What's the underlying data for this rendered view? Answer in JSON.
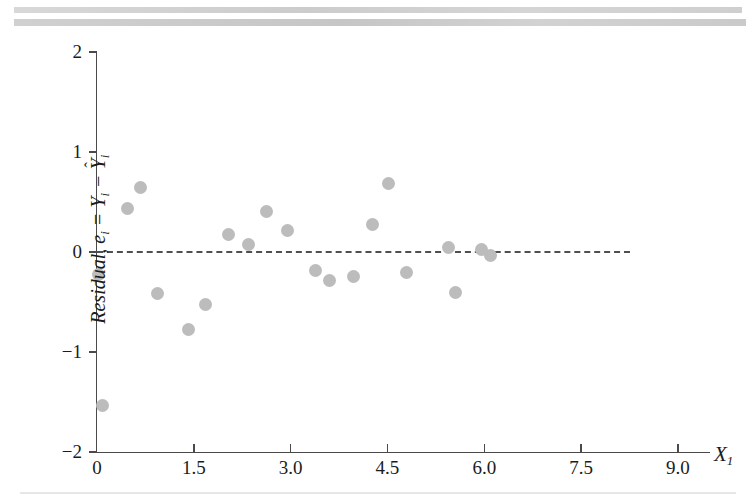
{
  "page": {
    "background_color": "#ffffff",
    "scan_band_color": "#d0d0d0"
  },
  "chart_data": {
    "type": "scatter",
    "title": "",
    "subtitle": "",
    "xlabel": "X1",
    "xlabel_display": "X",
    "xlabel_sub": "1",
    "ylabel": "Residual, e_i = Y_i - Y-hat_i",
    "ylabel_parts": {
      "word": "Residual,",
      "e": "e",
      "e_sub": "i",
      "equals": "=",
      "y": "Y",
      "y_sub": "i",
      "minus": "−",
      "yhat": "Y",
      "yhat_sub": "i",
      "hat": "ˆ"
    },
    "xlim": [
      0,
      9.3
    ],
    "ylim": [
      -2,
      2
    ],
    "xticks": [
      0,
      1.5,
      3.0,
      4.5,
      6.0,
      7.5,
      9.0
    ],
    "xtick_labels": [
      "0",
      "1.5",
      "3.0",
      "4.5",
      "6.0",
      "7.5",
      "9.0"
    ],
    "yticks": [
      -2,
      -1,
      0,
      1,
      2
    ],
    "ytick_labels": [
      "−2",
      "−1",
      "0",
      "1",
      "2"
    ],
    "grid": false,
    "legend": null,
    "reference_line": {
      "kind": "horizontal-dashed",
      "y": 0,
      "x_start": 0,
      "x_end": 8.25,
      "color": "#4f4f4f",
      "style": "dashed"
    },
    "point_color": "#bcbcbc",
    "point_radius_px": 6.5,
    "points": [
      {
        "x": 0.02,
        "y": -0.22
      },
      {
        "x": 0.08,
        "y": -1.53
      },
      {
        "x": 0.48,
        "y": 0.44
      },
      {
        "x": 0.67,
        "y": 0.645
      },
      {
        "x": 0.93,
        "y": -0.41
      },
      {
        "x": 1.42,
        "y": -0.77
      },
      {
        "x": 1.68,
        "y": -0.52
      },
      {
        "x": 2.03,
        "y": 0.18
      },
      {
        "x": 2.35,
        "y": 0.08
      },
      {
        "x": 2.63,
        "y": 0.41
      },
      {
        "x": 2.95,
        "y": 0.22
      },
      {
        "x": 3.38,
        "y": -0.18
      },
      {
        "x": 3.6,
        "y": -0.28
      },
      {
        "x": 3.97,
        "y": -0.24
      },
      {
        "x": 4.27,
        "y": 0.28
      },
      {
        "x": 4.52,
        "y": 0.69
      },
      {
        "x": 4.8,
        "y": -0.2
      },
      {
        "x": 5.45,
        "y": 0.05
      },
      {
        "x": 5.55,
        "y": -0.4
      },
      {
        "x": 5.95,
        "y": 0.03
      },
      {
        "x": 6.1,
        "y": -0.03
      }
    ]
  }
}
